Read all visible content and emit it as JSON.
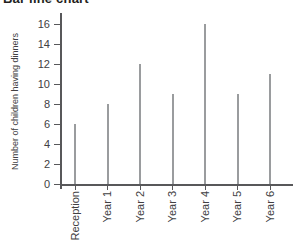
{
  "colors": {
    "bar": "#9a9c9e",
    "axis": "#58585a",
    "text": "#414042",
    "title": "#231f20",
    "background": "#ffffff"
  },
  "chart_data": {
    "type": "bar",
    "bar_style": "thin-line",
    "title": "Bar line chart",
    "xlabel": "",
    "ylabel": "Number of children having dinners",
    "categories": [
      "Reception",
      "Year 1",
      "Year 2",
      "Year 3",
      "Year 4",
      "Year 5",
      "Year 6"
    ],
    "values": [
      6,
      8,
      12,
      9,
      16,
      9,
      11
    ],
    "ylim": [
      0,
      16
    ],
    "ytick_step": 2,
    "yticks": [
      0,
      2,
      4,
      6,
      8,
      10,
      12,
      14,
      16
    ],
    "grid": false,
    "legend": "none"
  }
}
